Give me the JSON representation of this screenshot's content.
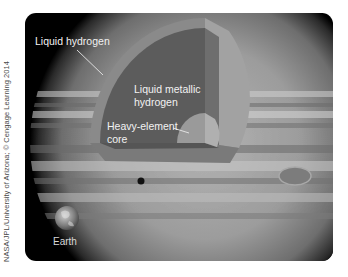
{
  "figure": {
    "credit": "NASA/JPL/University of Arizona; © Cengage Learning 2014",
    "layers": [
      {
        "id": "liquid-hydrogen",
        "label": "Liquid hydrogen",
        "color": "#8a8a8a"
      },
      {
        "id": "liquid-metallic-hydrogen",
        "label_line1": "Liquid metallic",
        "label_line2": "hydrogen",
        "color": "#5c5c5c"
      },
      {
        "id": "heavy-element-core",
        "label_line1": "Heavy-element",
        "label_line2": "core",
        "color": "#9a9a9a"
      }
    ],
    "comparison": {
      "label": "Earth"
    },
    "colors": {
      "background": "#000000",
      "page": "#ffffff",
      "label_text": "#f2f2f2",
      "credit_text": "#4a4a4a"
    }
  }
}
